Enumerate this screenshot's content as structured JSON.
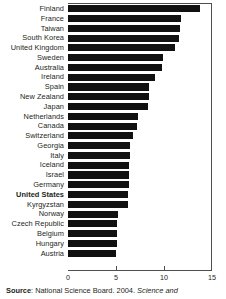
{
  "chart_data": {
    "type": "bar",
    "orientation": "horizontal",
    "title": "",
    "subtitle": "",
    "xlabel": "",
    "ylabel": "",
    "xlim": [
      0,
      15
    ],
    "xticks": [
      0,
      5,
      10,
      15
    ],
    "xtick_labels": [
      "0",
      "5",
      "10",
      "15"
    ],
    "grid": false,
    "legend": false,
    "bar_color": "#111111",
    "axis_color": "#4f4f4f",
    "highlight_category": "United States",
    "categories": [
      "Finland",
      "France",
      "Taiwan",
      "South Korea",
      "United Kingdom",
      "Sweden",
      "Australia",
      "Ireland",
      "Spain",
      "New Zealand",
      "Japan",
      "Netherlands",
      "Canada",
      "Switzerland",
      "Georgia",
      "Italy",
      "Iceland",
      "Israel",
      "Germany",
      "United States",
      "Kyrgyzstan",
      "Norway",
      "Czech Republic",
      "Belgium",
      "Hungary",
      "Austria"
    ],
    "values": [
      13.8,
      11.8,
      11.7,
      11.6,
      11.1,
      9.9,
      9.8,
      9.1,
      8.4,
      8.4,
      8.3,
      7.3,
      7.2,
      6.8,
      6.5,
      6.5,
      6.4,
      6.4,
      6.4,
      6.3,
      6.3,
      5.2,
      5.1,
      5.1,
      5.1,
      5.0
    ]
  },
  "source": {
    "label": "Source",
    "separator": ": ",
    "publisher": "National Science Board. 2004. ",
    "italic_title": "Science and"
  }
}
